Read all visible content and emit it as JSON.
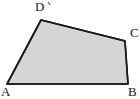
{
  "figure": {
    "kind": "quadrilateral-diagram",
    "shape_name": "quadrilateral ABCD",
    "background_color": "#ffffff",
    "fill_color": "#d5d5d5",
    "stroke_color": "#1a1a1a",
    "stroke_width": 1.6,
    "canvas": {
      "width": 140,
      "height": 99
    },
    "vertices": [
      {
        "id": "A",
        "label": "A",
        "x": 7,
        "y": 84,
        "label_x": 1,
        "label_y": 85
      },
      {
        "id": "B",
        "label": "B",
        "x": 128,
        "y": 84,
        "label_x": 128,
        "label_y": 85
      },
      {
        "id": "C",
        "label": "C",
        "x": 125,
        "y": 41,
        "label_x": 130,
        "label_y": 26
      },
      {
        "id": "D",
        "label": "D",
        "x": 41,
        "y": 20,
        "label_x": 35,
        "label_y": 0
      }
    ],
    "edges": [
      {
        "from": "A",
        "to": "B"
      },
      {
        "from": "B",
        "to": "C"
      },
      {
        "from": "C",
        "to": "D"
      },
      {
        "from": "D",
        "to": "A"
      }
    ],
    "polygon_points": "7,84 128,84 125,41 41,20",
    "marks": [
      {
        "id": "tick-above-D",
        "kind": "tick",
        "x1": 48,
        "y1": 2,
        "x2": 50,
        "y2": 5
      }
    ]
  }
}
